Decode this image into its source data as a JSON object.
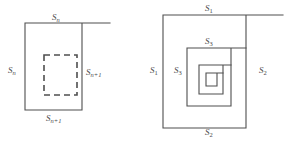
{
  "figure": {
    "background_color": "#ffffff",
    "stroke_color": "#4f4f4f",
    "label_color": "#4a4a4a",
    "width": 293,
    "height": 149
  },
  "left_diagram": {
    "name": "solid square with dashed inner square",
    "outer_square": {
      "x": 25,
      "y": 23,
      "width": 57,
      "height": 87,
      "stroke_style": "solid",
      "top_edge_extends_to_x": 110
    },
    "inner_square": {
      "x": 44,
      "y": 55,
      "width": 33,
      "height": 40,
      "stroke_style": "dashed"
    },
    "labels": [
      {
        "id": "left-top",
        "base": "S",
        "sub": "n",
        "text": "Sn",
        "x": 52,
        "y": 13
      },
      {
        "id": "left-left",
        "base": "S",
        "sub": "n",
        "text": "Sn",
        "x": 8,
        "y": 66
      },
      {
        "id": "left-right",
        "base": "S",
        "sub": "n+1",
        "text": "Sn+1",
        "x": 86,
        "y": 68
      },
      {
        "id": "left-bottom",
        "base": "S",
        "sub": "n+1",
        "text": "Sn+1",
        "x": 46,
        "y": 114
      }
    ]
  },
  "right_diagram": {
    "name": "nested square spiral",
    "squares": [
      {
        "level": 1,
        "x": 163,
        "y": 15,
        "width": 83,
        "height": 113,
        "top_edge_extends_to_x": 283,
        "open_side": "top-right"
      },
      {
        "level": 2,
        "x": 187,
        "y": 48,
        "width": 44,
        "height": 58,
        "open_side": "top-right"
      },
      {
        "level": 3,
        "x": 199,
        "y": 65,
        "width": 24,
        "height": 29,
        "open_side": "top-right"
      },
      {
        "level": 4,
        "x": 206,
        "y": 73,
        "width": 11,
        "height": 13,
        "open_side": "top-right"
      }
    ],
    "labels": [
      {
        "id": "right-top-1",
        "base": "S",
        "sub": "1",
        "text": "S1",
        "x": 205,
        "y": 4
      },
      {
        "id": "right-left-1",
        "base": "S",
        "sub": "1",
        "text": "S1",
        "x": 150,
        "y": 66
      },
      {
        "id": "right-right-2",
        "base": "S",
        "sub": "2",
        "text": "S2",
        "x": 259,
        "y": 66
      },
      {
        "id": "right-bottom-2",
        "base": "S",
        "sub": "2",
        "text": "S2",
        "x": 205,
        "y": 128
      },
      {
        "id": "right-top-3",
        "base": "S",
        "sub": "3",
        "text": "S3",
        "x": 205,
        "y": 37
      },
      {
        "id": "right-left-3",
        "base": "S",
        "sub": "3",
        "text": "S3",
        "x": 174,
        "y": 66
      }
    ]
  }
}
